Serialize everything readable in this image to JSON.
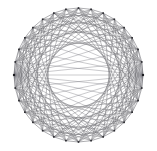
{
  "figure": {
    "background_color": "#ffffff",
    "width": 157,
    "height": 151
  },
  "style": {
    "edge_color": "#6e6e72",
    "hub_edge_color": "#7a7a80",
    "rim_edge_color": "#5d5d63",
    "node_color": "#2b2b30",
    "hub_node_color": "#1c1c20",
    "edge_width": 0.45,
    "node_size": 1.6,
    "hub_node_size": 2.1
  },
  "graph_data": {
    "type": "node-link",
    "layout": "circular",
    "node_count": 32,
    "ellipse": {
      "cx": 78.5,
      "cy": 75.0,
      "rx": 64.5,
      "ry": 67.0,
      "rotation_deg": 0
    },
    "hub_nodes": [
      0,
      16
    ],
    "hub_labels": [
      "left-pole-hub",
      "right-pole-hub"
    ],
    "node_angles_deg": [
      180,
      191.25,
      202.5,
      213.75,
      225,
      236.25,
      247.5,
      258.75,
      270,
      281.25,
      292.5,
      303.75,
      315,
      326.25,
      337.5,
      348.75,
      0,
      11.25,
      22.5,
      33.75,
      45,
      56.25,
      67.5,
      78.75,
      90,
      101.25,
      112.5,
      123.75,
      135,
      146.25,
      157.5,
      168.75
    ],
    "chord_skips": [
      5,
      7,
      9,
      11
    ],
    "rim_enabled": true,
    "hub_fan_enabled": true,
    "edge_count_estimate": 190
  }
}
